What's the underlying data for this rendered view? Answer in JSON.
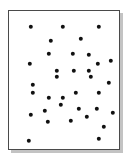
{
  "figure": {
    "kind": "scatter-point-pattern",
    "caption": "",
    "background_color": "#ffffff",
    "frame": {
      "border_color": "#4a4a4a",
      "border_width_px": 1.4,
      "fill_color": "#ffffff",
      "shadow_color": "#b9b9b9",
      "left_px": 8,
      "top_px": 10,
      "width_px": 112,
      "height_px": 140
    }
  },
  "chart_data": {
    "type": "scatter",
    "title": "",
    "subtitle": "",
    "xlabel": "",
    "ylabel": "",
    "xlim": [
      0,
      112
    ],
    "ylim": [
      0,
      140
    ],
    "grid": false,
    "legend": null,
    "axis_ticks": {
      "x": [],
      "y": []
    },
    "marker": {
      "shape": "circle",
      "color": "#111111",
      "size_px": 4.4,
      "filled": true
    },
    "n_points": 34,
    "points": [
      {
        "x": 22,
        "y": 16
      },
      {
        "x": 54,
        "y": 16
      },
      {
        "x": 90,
        "y": 16
      },
      {
        "x": 42,
        "y": 30
      },
      {
        "x": 72,
        "y": 28
      },
      {
        "x": 40,
        "y": 43
      },
      {
        "x": 64,
        "y": 43
      },
      {
        "x": 80,
        "y": 44
      },
      {
        "x": 102,
        "y": 50
      },
      {
        "x": 21,
        "y": 53
      },
      {
        "x": 89,
        "y": 53
      },
      {
        "x": 48,
        "y": 60
      },
      {
        "x": 65,
        "y": 60
      },
      {
        "x": 80,
        "y": 60
      },
      {
        "x": 48,
        "y": 66
      },
      {
        "x": 82,
        "y": 66
      },
      {
        "x": 100,
        "y": 72
      },
      {
        "x": 24,
        "y": 74
      },
      {
        "x": 24,
        "y": 82
      },
      {
        "x": 67,
        "y": 82
      },
      {
        "x": 90,
        "y": 82
      },
      {
        "x": 40,
        "y": 87
      },
      {
        "x": 54,
        "y": 87
      },
      {
        "x": 52,
        "y": 94
      },
      {
        "x": 36,
        "y": 100
      },
      {
        "x": 70,
        "y": 98
      },
      {
        "x": 88,
        "y": 98
      },
      {
        "x": 104,
        "y": 102
      },
      {
        "x": 22,
        "y": 104
      },
      {
        "x": 39,
        "y": 111
      },
      {
        "x": 62,
        "y": 110
      },
      {
        "x": 78,
        "y": 106
      },
      {
        "x": 95,
        "y": 116
      },
      {
        "x": 20,
        "y": 130
      },
      {
        "x": 90,
        "y": 128
      }
    ]
  }
}
